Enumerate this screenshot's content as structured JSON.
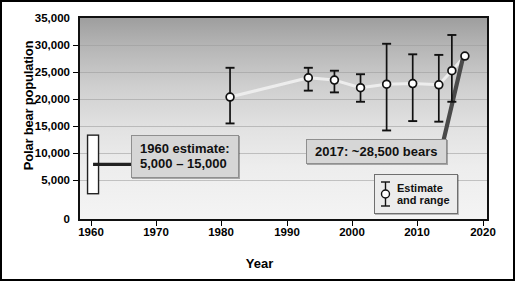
{
  "chart_data": {
    "type": "line",
    "title": "",
    "xlabel": "Year",
    "ylabel": "Polar bear population",
    "xlim": [
      1958,
      2021
    ],
    "ylim": [
      0,
      35000
    ],
    "grid": true,
    "legend_position": "bottom-right",
    "ytick_labels": [
      "35,000",
      "30,000",
      "25,000",
      "20,000",
      "15,000",
      "10,000",
      "5,000",
      "0"
    ],
    "ytick_values": [
      35000,
      30000,
      25000,
      20000,
      15000,
      10000,
      5000,
      0
    ],
    "xtick_labels": [
      "1960",
      "1970",
      "1980",
      "1990",
      "2000",
      "2010",
      "2020"
    ],
    "xtick_values": [
      1960,
      1970,
      1980,
      1990,
      2000,
      2010,
      2020
    ],
    "series": [
      {
        "name": "Estimate and range",
        "x": [
          1981,
          1993,
          1997,
          2001,
          2005,
          2009,
          2013,
          2015,
          2017
        ],
        "values": [
          21500,
          24800,
          24400,
          23100,
          23700,
          23800,
          23600,
          26000,
          28500
        ],
        "low": [
          17000,
          22600,
          22300,
          20700,
          15800,
          17400,
          17300,
          20700,
          null
        ],
        "high": [
          26500,
          26500,
          26000,
          25400,
          30600,
          28800,
          28700,
          32100,
          null
        ]
      }
    ],
    "annotations": [
      {
        "name": "1960-estimate",
        "text": "1960 estimate:\n5,000 – 15,000",
        "range_low": 5000,
        "range_high": 15000,
        "year": 1960
      },
      {
        "name": "2017-estimate",
        "text": "2017: ~28,500 bears",
        "value": 28500,
        "year": 2017
      }
    ],
    "legend": {
      "line1": "Estimate",
      "line2": "and range",
      "marker": "errorbar-circle-marker"
    },
    "colors": {
      "line": "#ededed",
      "marker_fill": "#ffffff",
      "marker_edge": "#111111",
      "errorbar": "#111111",
      "callout_bg": "#d6d6d6",
      "plot_border": "#111111",
      "gridline": "#9a9a9a"
    }
  }
}
